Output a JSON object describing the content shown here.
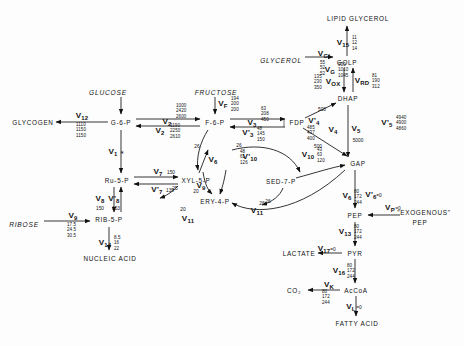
{
  "diagram": {
    "metabolites": [
      {
        "id": "glucose",
        "label": "GLUCOSE",
        "x": 108,
        "y": 92,
        "style": "ital"
      },
      {
        "id": "fructose",
        "label": "FRUCTOSE",
        "x": 216,
        "y": 92,
        "style": "ital"
      },
      {
        "id": "glycerol",
        "label": "GLYCEROL",
        "x": 281,
        "y": 60,
        "style": "ital"
      },
      {
        "id": "ribose",
        "label": "RIBOSE",
        "x": 24,
        "y": 224,
        "style": "ital"
      },
      {
        "id": "glycogen",
        "label": "GLYCOGEN",
        "x": 33,
        "y": 122,
        "style": "met"
      },
      {
        "id": "g6p",
        "label": "G-6-P",
        "x": 121,
        "y": 122,
        "style": "met"
      },
      {
        "id": "f6p",
        "label": "F-6-P",
        "x": 215,
        "y": 122,
        "style": "met"
      },
      {
        "id": "fdp",
        "label": "FDP",
        "x": 297,
        "y": 122,
        "style": "met"
      },
      {
        "id": "dhap",
        "label": "DHAP",
        "x": 348,
        "y": 98,
        "style": "met"
      },
      {
        "id": "gap",
        "label": "GAP",
        "x": 358,
        "y": 163,
        "style": "met"
      },
      {
        "id": "golp",
        "label": "GOLP",
        "x": 347,
        "y": 62,
        "style": "met"
      },
      {
        "id": "lipid_glycerol",
        "label": "LIPID GLYCEROL",
        "x": 358,
        "y": 18,
        "style": "met"
      },
      {
        "id": "ru5p",
        "label": "Ru-5-P",
        "x": 117,
        "y": 180,
        "style": "met"
      },
      {
        "id": "xyl5p",
        "label": "XYL-5-P",
        "x": 196,
        "y": 180,
        "style": "met"
      },
      {
        "id": "rib5p",
        "label": "RIB-5-P",
        "x": 109,
        "y": 219,
        "style": "met"
      },
      {
        "id": "ery4p",
        "label": "ERY-4-P",
        "x": 215,
        "y": 201,
        "style": "met"
      },
      {
        "id": "sed7p",
        "label": "SED-7-P",
        "x": 281,
        "y": 181,
        "style": "met"
      },
      {
        "id": "nucleic_acid",
        "label": "NUCLEIC ACID",
        "x": 110,
        "y": 258,
        "style": "met"
      },
      {
        "id": "pep",
        "label": "PEP",
        "x": 355,
        "y": 215,
        "style": "met"
      },
      {
        "id": "exogenous_pep",
        "label": "\"EXOGENOUS\"",
        "x": 424,
        "y": 212,
        "style": "met"
      },
      {
        "id": "exogenous_pep2",
        "label": "PEP",
        "x": 420,
        "y": 222,
        "style": "met"
      },
      {
        "id": "pyr",
        "label": "PYR",
        "x": 355,
        "y": 253,
        "style": "met"
      },
      {
        "id": "lactate",
        "label": "LACTATE",
        "x": 299,
        "y": 253,
        "style": "met"
      },
      {
        "id": "accoa",
        "label": "AcCoA",
        "x": 356,
        "y": 290,
        "style": "met"
      },
      {
        "id": "co2",
        "label": "CO₂",
        "x": 294,
        "y": 290,
        "style": "met"
      },
      {
        "id": "fatty_acid",
        "label": "FATTY ACID",
        "x": 357,
        "y": 323,
        "style": "met"
      }
    ],
    "flux_labels": [
      {
        "id": "vG",
        "label": "V",
        "sub": "G",
        "x": 330,
        "y": 70,
        "note": "glucose uptake"
      },
      {
        "id": "v12",
        "label": "V",
        "sub": "12",
        "x": 82,
        "y": 116
      },
      {
        "id": "v1",
        "label": "V",
        "sub": "1",
        "x": 113,
        "y": 152
      },
      {
        "id": "v2a",
        "label": "V",
        "sub": "2",
        "x": 167,
        "y": 122
      },
      {
        "id": "v2b",
        "label": "V",
        "sub": "2",
        "x": 160,
        "y": 131
      },
      {
        "id": "vF",
        "label": "V",
        "sub": "F",
        "x": 223,
        "y": 104
      },
      {
        "id": "v3",
        "label": "V",
        "sub": "3",
        "x": 252,
        "y": 123
      },
      {
        "id": "v3p",
        "label": "V'",
        "sub": "3",
        "x": 248,
        "y": 133
      },
      {
        "id": "v4p",
        "label": "V'",
        "sub": "4",
        "x": 314,
        "y": 121
      },
      {
        "id": "v4",
        "label": "V",
        "sub": "4",
        "x": 333,
        "y": 130
      },
      {
        "id": "v5",
        "label": "V",
        "sub": "5",
        "x": 356,
        "y": 129
      },
      {
        "id": "v5p",
        "label": "V'",
        "sub": "5",
        "x": 387,
        "y": 123
      },
      {
        "id": "vGL",
        "label": "V",
        "sub": "GL",
        "x": 325,
        "y": 54
      },
      {
        "id": "vOX",
        "label": "V",
        "sub": "OX",
        "x": 333,
        "y": 82
      },
      {
        "id": "vRD",
        "label": "V",
        "sub": "RD",
        "x": 362,
        "y": 81
      },
      {
        "id": "v15",
        "label": "V",
        "sub": "15",
        "x": 343,
        "y": 43
      },
      {
        "id": "v7",
        "label": "V",
        "sub": "7",
        "x": 158,
        "y": 172
      },
      {
        "id": "v7p",
        "label": "V'",
        "sub": "7",
        "x": 157,
        "y": 190
      },
      {
        "id": "v8",
        "label": "V",
        "sub": "8",
        "x": 100,
        "y": 199
      },
      {
        "id": "v8p",
        "label": "V'",
        "sub": "8",
        "x": 114,
        "y": 199
      },
      {
        "id": "v9",
        "label": "V",
        "sub": "9",
        "x": 73,
        "y": 216
      },
      {
        "id": "v14",
        "label": "V",
        "sub": "14",
        "x": 105,
        "y": 243
      },
      {
        "id": "v6",
        "label": "V",
        "sub": "6",
        "x": 347,
        "y": 196
      },
      {
        "id": "v6p",
        "label": "V'",
        "sub": "6",
        "x": 371,
        "y": 195
      },
      {
        "id": "vP",
        "label": "V",
        "sub": "P",
        "x": 390,
        "y": 208
      },
      {
        "id": "v13",
        "label": "V",
        "sub": "13",
        "x": 345,
        "y": 232
      },
      {
        "id": "v17",
        "label": "V",
        "sub": "17",
        "x": 324,
        "y": 249
      },
      {
        "id": "v16",
        "label": "V",
        "sub": "16",
        "x": 339,
        "y": 271
      },
      {
        "id": "vK",
        "label": "V",
        "sub": "K",
        "x": 329,
        "y": 285
      },
      {
        "id": "vL",
        "label": "V",
        "sub": "L",
        "x": 351,
        "y": 307
      },
      {
        "id": "v6small",
        "label": "V",
        "sub": "6",
        "x": 213,
        "y": 160
      },
      {
        "id": "v9small",
        "label": "V",
        "sub": "9",
        "x": 201,
        "y": 186
      },
      {
        "id": "v10p",
        "label": "V'",
        "sub": "10",
        "x": 250,
        "y": 157
      },
      {
        "id": "v10",
        "label": "V",
        "sub": "10",
        "x": 308,
        "y": 155
      },
      {
        "id": "v11",
        "label": "V",
        "sub": "11",
        "x": 257,
        "y": 211
      },
      {
        "id": "v11b",
        "label": "V",
        "sub": "11",
        "x": 188,
        "y": 219
      }
    ],
    "flux_values": [
      {
        "id": "vG_vals",
        "owner": "vG",
        "values": [
          "930",
          "1010",
          "1045"
        ],
        "x": 338,
        "y": 70
      },
      {
        "id": "v12_vals",
        "owner": "v12",
        "values": [
          "1110",
          "1150",
          "1150"
        ],
        "x": 76,
        "y": 130
      },
      {
        "id": "v2a_vals",
        "owner": "v2",
        "values": [
          "1000",
          "2420",
          "2600"
        ],
        "x": 176,
        "y": 111
      },
      {
        "id": "v2b_vals",
        "owner": "v2p",
        "values": [
          "1190",
          "2250",
          "2610"
        ],
        "x": 170,
        "y": 131
      },
      {
        "id": "vF_vals",
        "owner": "vF",
        "values": [
          "194",
          "200",
          "200"
        ],
        "x": 231,
        "y": 104
      },
      {
        "id": "v3_vals",
        "owner": "v3",
        "values": [
          "63",
          "208",
          "450"
        ],
        "x": 261,
        "y": 114
      },
      {
        "id": "v3p_vals",
        "owner": "v3p",
        "values": [
          "48",
          "145",
          "150"
        ],
        "x": 257,
        "y": 134
      },
      {
        "id": "v4p_vals",
        "owner": "v4p",
        "values": [
          "485",
          "437",
          "400"
        ],
        "x": 307,
        "y": 133
      },
      {
        "id": "v5p_vals",
        "owner": "v5p",
        "values": [
          "4940",
          "4900",
          "4860"
        ],
        "x": 396,
        "y": 123
      },
      {
        "id": "vGL_vals",
        "owner": "vGL",
        "values": [
          "55",
          "52",
          "52"
        ],
        "x": 320,
        "y": 68
      },
      {
        "id": "vOX_vals",
        "owner": "vOX",
        "values": [
          "135",
          "230",
          "350"
        ],
        "x": 314,
        "y": 82
      },
      {
        "id": "vRD_vals",
        "owner": "vRD",
        "values": [
          "81",
          "190",
          "312"
        ],
        "x": 372,
        "y": 81
      },
      {
        "id": "v15_vals",
        "owner": "v15",
        "values": [
          "11",
          "12",
          "14"
        ],
        "x": 352,
        "y": 43
      },
      {
        "id": "v9_vals",
        "owner": "v9",
        "values": [
          "17.5",
          "24.5",
          "30.5"
        ],
        "x": 67,
        "y": 230
      },
      {
        "id": "v14_vals",
        "owner": "v14",
        "values": [
          "8.5",
          "16",
          "22"
        ],
        "x": 114,
        "y": 243
      },
      {
        "id": "v6_vals",
        "owner": "v6",
        "values": [
          "80",
          "172",
          "244"
        ],
        "x": 354,
        "y": 197
      },
      {
        "id": "v13_vals",
        "owner": "v13",
        "values": [
          "80",
          "172",
          "244"
        ],
        "x": 354,
        "y": 232
      },
      {
        "id": "v16_vals",
        "owner": "v16",
        "values": [
          "80",
          "172",
          "244"
        ],
        "x": 347,
        "y": 271
      },
      {
        "id": "vK_vals",
        "owner": "vK",
        "values": [
          "80",
          "172",
          "244"
        ],
        "x": 322,
        "y": 297
      },
      {
        "id": "v10p_vals",
        "owner": "v10p",
        "values": [
          "48",
          "61",
          "126"
        ],
        "x": 240,
        "y": 157
      },
      {
        "id": "v10_vals",
        "owner": "v10",
        "values": [
          "43",
          "63",
          "120"
        ],
        "x": 317,
        "y": 155
      }
    ],
    "inline_values": [
      {
        "id": "v5_val",
        "text": "5000",
        "x": 358,
        "y": 140
      },
      {
        "id": "v4_curve_top",
        "text": "500",
        "x": 322,
        "y": 109
      },
      {
        "id": "v4_curve_bot",
        "text": "500",
        "x": 318,
        "y": 146
      },
      {
        "id": "v7_val",
        "text": "150",
        "x": 171,
        "y": 172
      },
      {
        "id": "v7p_val",
        "text": "139",
        "x": 170,
        "y": 190
      },
      {
        "id": "v8_val",
        "text": "150",
        "x": 100,
        "y": 208
      },
      {
        "id": "v8p_val",
        "text": "153",
        "x": 116,
        "y": 208
      },
      {
        "id": "f6p_left_26",
        "text": "26",
        "x": 197,
        "y": 146
      },
      {
        "id": "f6p_26",
        "text": "26",
        "x": 239,
        "y": 145
      },
      {
        "id": "gap_26",
        "text": "26",
        "x": 268,
        "y": 201
      },
      {
        "id": "xyl_25",
        "text": "25",
        "x": 175,
        "y": 188
      },
      {
        "id": "xyl_20",
        "text": "20",
        "x": 196,
        "y": 191
      },
      {
        "id": "ery_20",
        "text": "20",
        "x": 183,
        "y": 209
      },
      {
        "id": "v11_26",
        "text": "26",
        "x": 262,
        "y": 203
      },
      {
        "id": "v6p_zero",
        "text": "=0",
        "x": 379,
        "y": 195
      },
      {
        "id": "vP_zero",
        "text": "=0",
        "x": 398,
        "y": 208
      },
      {
        "id": "v17_zero",
        "text": "=0",
        "x": 333,
        "y": 249
      },
      {
        "id": "vL_zero",
        "text": "=0",
        "x": 359,
        "y": 307
      },
      {
        "id": "v1_dot",
        "text": "∗",
        "x": 122,
        "y": 152
      }
    ]
  }
}
